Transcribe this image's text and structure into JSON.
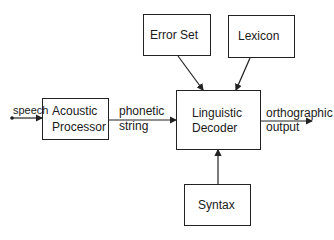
{
  "diagram": {
    "type": "block-diagram",
    "nodes": [
      {
        "id": "acoustic",
        "lines": [
          "Acoustic",
          "Processor"
        ]
      },
      {
        "id": "decoder",
        "lines": [
          "Linguistic",
          "Decoder"
        ]
      },
      {
        "id": "errorset",
        "label": "Error Set"
      },
      {
        "id": "lexicon",
        "label": "Lexicon"
      },
      {
        "id": "syntax",
        "label": "Syntax"
      }
    ],
    "edges": [
      {
        "from": "input",
        "to": "acoustic",
        "label": "speech"
      },
      {
        "from": "acoustic",
        "to": "decoder",
        "lines": [
          "phonetic",
          "string"
        ]
      },
      {
        "from": "errorset",
        "to": "decoder"
      },
      {
        "from": "lexicon",
        "to": "decoder"
      },
      {
        "from": "syntax",
        "to": "decoder"
      },
      {
        "from": "decoder",
        "to": "output",
        "lines": [
          "orthographic",
          "output"
        ]
      }
    ]
  }
}
